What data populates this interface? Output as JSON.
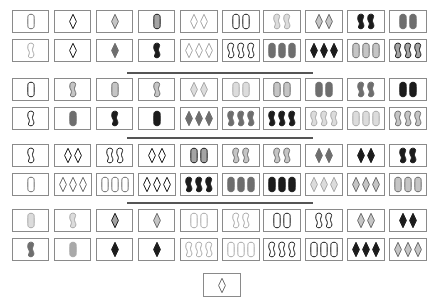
{
  "palette": {
    "L": "#a9a9a9",
    "M": "#6e6e6e",
    "D": "#1c1c1c"
  },
  "board": {
    "columns": 10,
    "groups": [
      {
        "rows": [
          [
            [
              "1",
              "oval",
              "e",
              "M"
            ],
            [
              "1",
              "diamond",
              "e",
              "D"
            ],
            [
              "1",
              "diamond",
              "s",
              "M"
            ],
            [
              "1",
              "oval",
              "s",
              "D"
            ],
            [
              "2",
              "diamond",
              "e",
              "L"
            ],
            [
              "2",
              "oval",
              "e",
              "D"
            ],
            [
              "2",
              "squiggle",
              "s",
              "L"
            ],
            [
              "2",
              "diamond",
              "s",
              "M"
            ],
            [
              "2",
              "squiggle",
              "f",
              "D"
            ],
            [
              "2",
              "oval",
              "f",
              "M"
            ]
          ],
          [
            [
              "1",
              "squiggle",
              "e",
              "L"
            ],
            [
              "1",
              "diamond",
              "e",
              "D"
            ],
            [
              "1",
              "diamond",
              "f",
              "M"
            ],
            [
              "1",
              "squiggle",
              "f",
              "D"
            ],
            [
              "3",
              "diamond",
              "e",
              "L"
            ],
            [
              "3",
              "squiggle",
              "e",
              "D"
            ],
            [
              "3",
              "oval",
              "f",
              "M"
            ],
            [
              "3",
              "diamond",
              "f",
              "D"
            ],
            [
              "3",
              "oval",
              "s",
              "M"
            ],
            [
              "3",
              "squiggle",
              "s",
              "D"
            ]
          ]
        ]
      },
      {
        "rows": [
          [
            [
              "1",
              "oval",
              "e",
              "D"
            ],
            [
              "1",
              "squiggle",
              "s",
              "M"
            ],
            [
              "1",
              "oval",
              "s",
              "M"
            ],
            [
              "1",
              "squiggle",
              "s",
              "M"
            ],
            [
              "2",
              "diamond",
              "s",
              "L"
            ],
            [
              "2",
              "oval",
              "s",
              "L"
            ],
            [
              "2",
              "oval",
              "s",
              "M"
            ],
            [
              "2",
              "oval",
              "f",
              "M"
            ],
            [
              "2",
              "squiggle",
              "f",
              "M"
            ],
            [
              "2",
              "oval",
              "f",
              "D"
            ]
          ],
          [
            [
              "1",
              "squiggle",
              "e",
              "D"
            ],
            [
              "1",
              "oval",
              "f",
              "M"
            ],
            [
              "1",
              "squiggle",
              "f",
              "D"
            ],
            [
              "1",
              "oval",
              "f",
              "D"
            ],
            [
              "3",
              "diamond",
              "f",
              "M"
            ],
            [
              "3",
              "squiggle",
              "f",
              "M"
            ],
            [
              "3",
              "squiggle",
              "f",
              "D"
            ],
            [
              "3",
              "squiggle",
              "s",
              "L"
            ],
            [
              "3",
              "oval",
              "s",
              "L"
            ],
            [
              "3",
              "squiggle",
              "s",
              "M"
            ]
          ]
        ]
      },
      {
        "rows": [
          [
            [
              "1",
              "squiggle",
              "e",
              "D"
            ],
            [
              "2",
              "diamond",
              "e",
              "D"
            ],
            [
              "2",
              "squiggle",
              "e",
              "D"
            ],
            [
              "2",
              "diamond",
              "e",
              "D"
            ],
            [
              "2",
              "oval",
              "s",
              "D"
            ],
            [
              "2",
              "squiggle",
              "s",
              "M"
            ],
            [
              "2",
              "squiggle",
              "s",
              "M"
            ],
            [
              "2",
              "diamond",
              "f",
              "M"
            ],
            [
              "2",
              "diamond",
              "f",
              "D"
            ],
            [
              "2",
              "squiggle",
              "f",
              "D"
            ]
          ],
          [
            [
              "1",
              "oval",
              "e",
              "M"
            ],
            [
              "3",
              "diamond",
              "e",
              "M"
            ],
            [
              "3",
              "oval",
              "e",
              "M"
            ],
            [
              "3",
              "diamond",
              "e",
              "D"
            ],
            [
              "3",
              "squiggle",
              "f",
              "D"
            ],
            [
              "3",
              "oval",
              "f",
              "M"
            ],
            [
              "3",
              "oval",
              "f",
              "D"
            ],
            [
              "3",
              "diamond",
              "s",
              "L"
            ],
            [
              "3",
              "diamond",
              "s",
              "M"
            ],
            [
              "3",
              "oval",
              "s",
              "M"
            ]
          ]
        ]
      },
      {
        "rows": [
          [
            [
              "1",
              "oval",
              "s",
              "L"
            ],
            [
              "1",
              "squiggle",
              "s",
              "L"
            ],
            [
              "1",
              "diamond",
              "s",
              "D"
            ],
            [
              "1",
              "diamond",
              "s",
              "M"
            ],
            [
              "2",
              "oval",
              "e",
              "L"
            ],
            [
              "2",
              "squiggle",
              "e",
              "L"
            ],
            [
              "2",
              "oval",
              "e",
              "D"
            ],
            [
              "2",
              "squiggle",
              "e",
              "D"
            ],
            [
              "2",
              "diamond",
              "s",
              "M"
            ],
            [
              "2",
              "diamond",
              "f",
              "D"
            ]
          ],
          [
            [
              "1",
              "squiggle",
              "f",
              "M"
            ],
            [
              "1",
              "oval",
              "f",
              "L"
            ],
            [
              "1",
              "diamond",
              "f",
              "D"
            ],
            [
              "1",
              "diamond",
              "f",
              "D"
            ],
            [
              "3",
              "squiggle",
              "e",
              "L"
            ],
            [
              "3",
              "oval",
              "e",
              "L"
            ],
            [
              "3",
              "squiggle",
              "e",
              "D"
            ],
            [
              "3",
              "oval",
              "e",
              "D"
            ],
            [
              "3",
              "diamond",
              "f",
              "D"
            ],
            [
              "3",
              "diamond",
              "s",
              "M"
            ]
          ]
        ]
      }
    ]
  },
  "hand": {
    "card": [
      "1",
      "diamond",
      "e",
      "M"
    ]
  }
}
